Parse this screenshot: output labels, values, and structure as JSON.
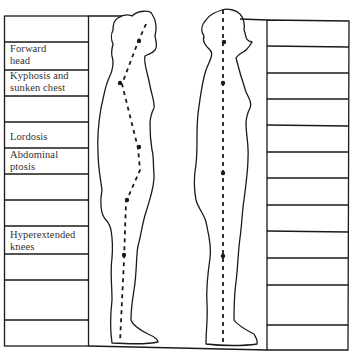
{
  "diagram": {
    "title": "",
    "left_table": {
      "rows": [
        {
          "label": ""
        },
        {
          "label": "Forward head",
          "line1": "Forward",
          "line2": "head"
        },
        {
          "label": "Kyphosis and sunken chest",
          "line1": "Kyphosis and",
          "line2": "sunken chest"
        },
        {
          "label": ""
        },
        {
          "label": "Lordosis",
          "line1": "Lordosis",
          "line2": ""
        },
        {
          "label": "Abdominal ptosis",
          "line1": "Abdominal",
          "line2": "ptosis"
        },
        {
          "label": ""
        },
        {
          "label": ""
        },
        {
          "label": "Hyperextended knees",
          "line1": "Hyperextended",
          "line2": "knees"
        },
        {
          "label": ""
        },
        {
          "label": ""
        },
        {
          "label": ""
        }
      ]
    },
    "right_table": {
      "rows": [
        {
          "label": ""
        },
        {
          "label": ""
        },
        {
          "label": ""
        },
        {
          "label": ""
        },
        {
          "label": ""
        },
        {
          "label": ""
        },
        {
          "label": ""
        },
        {
          "label": ""
        },
        {
          "label": ""
        },
        {
          "label": ""
        },
        {
          "label": ""
        },
        {
          "label": ""
        }
      ]
    },
    "figures": [
      {
        "name": "poor-posture",
        "description": "Side silhouette with curved dashed plumb line showing forward head, kyphosis, lordosis, abdominal ptosis, hyperextended knees"
      },
      {
        "name": "good-posture",
        "description": "Side silhouette with straight vertical dashed plumb line"
      }
    ],
    "colors": {
      "line": "#1a1a1a",
      "background": "#ffffff",
      "text": "#333333"
    }
  }
}
